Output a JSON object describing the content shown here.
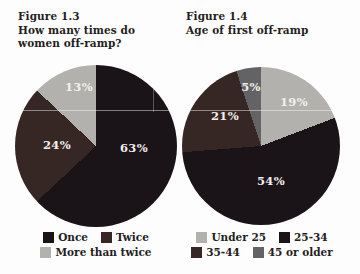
{
  "palette": {
    "background": "#fdfdfd",
    "title_text": "#241e21",
    "slice_label_text": "#f2efec",
    "black_slice": "#1a1317",
    "maroon_slice": "#372724",
    "light_gray_slice": "#b3b1ae",
    "slate_gray_slice": "#636265"
  },
  "chart_data": [
    {
      "type": "pie",
      "title": "Figure 1.3",
      "subtitle": "How many times do women off-ramp?",
      "title_lines": [
        "Figure 1.3",
        "How many times do",
        "women off-ramp?"
      ],
      "labels": [
        "Once",
        "Twice",
        "More than twice"
      ],
      "values": [
        63,
        24,
        13
      ],
      "display_values": [
        "63%",
        "24%",
        "13%"
      ],
      "colors": [
        "#1a1317",
        "#372724",
        "#b3b1ae"
      ],
      "start_angle_deg": 0,
      "direction": "clockwise",
      "legend_position": "bottom",
      "legend_rows": [
        [
          "Once",
          "Twice"
        ],
        [
          "More than twice"
        ]
      ],
      "label_positions_px": [
        [
          134,
          148
        ],
        [
          57,
          145
        ],
        [
          79,
          87
        ]
      ]
    },
    {
      "type": "pie",
      "title": "Figure 1.4",
      "subtitle": "Age of first off-ramp",
      "title_lines": [
        "Figure 1.4",
        "Age of first off-ramp"
      ],
      "labels": [
        "Under 25",
        "25-34",
        "35-44",
        "45 or older"
      ],
      "values": [
        19,
        54,
        21,
        5
      ],
      "display_values": [
        "19%",
        "54%",
        "21%",
        "5%"
      ],
      "colors": [
        "#b3b1ae",
        "#1a1317",
        "#372724",
        "#636265"
      ],
      "start_angle_deg": 0,
      "direction": "clockwise",
      "legend_position": "bottom",
      "legend_rows": [
        [
          "Under 25",
          "25-34"
        ],
        [
          "35-44",
          "45 or older"
        ]
      ],
      "label_positions_px": [
        [
          294,
          102
        ],
        [
          271,
          181
        ],
        [
          225,
          116
        ],
        [
          251,
          87
        ]
      ]
    }
  ]
}
